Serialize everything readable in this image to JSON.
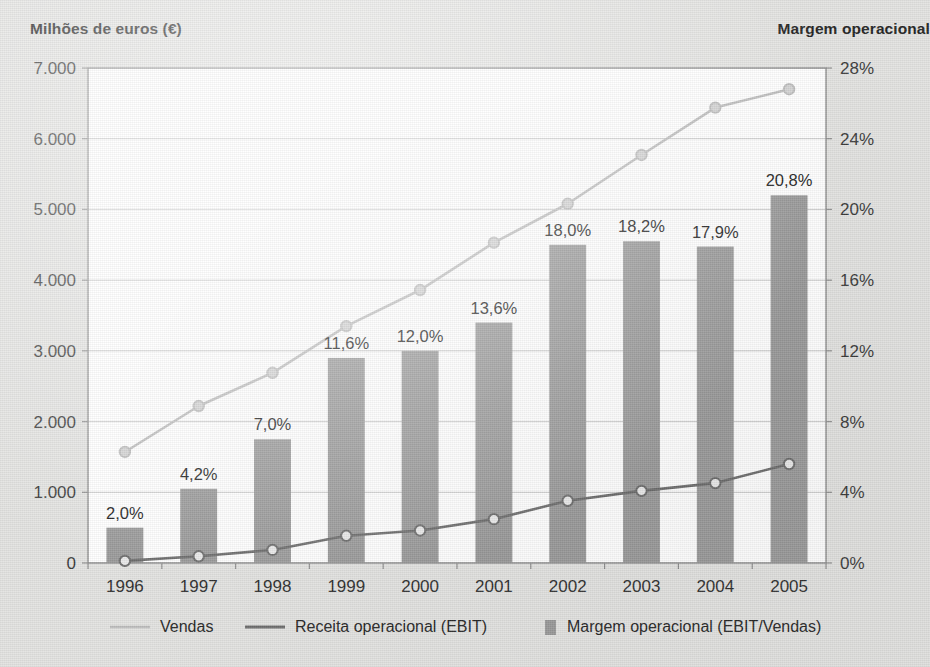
{
  "left_axis_title": "Milhões de euros (€)",
  "right_axis_title": "Margem operacional",
  "legend": [
    {
      "label": "Vendas",
      "marker": "line-light",
      "color": "#bdbdbd"
    },
    {
      "label": "Receita operacional (EBIT)",
      "marker": "line-dark",
      "color": "#6e6e6e"
    },
    {
      "label": "Margem operacional (EBIT/Vendas)",
      "marker": "bar-swatch",
      "color": "#9a9a9a"
    }
  ],
  "colors": {
    "background": "#e3e3e1",
    "plot_background": "#ffffff",
    "gridline": "#c9c9c9",
    "axis_border": "#8f8f8f",
    "bar_fill": "#9a9a9a",
    "vendas_line": "#bdbdbd",
    "ebit_line": "#6e6e6e",
    "text": "#2b2b2b"
  },
  "chart_data": {
    "type": "bar",
    "title": "",
    "subtitle": "",
    "xlabel": "",
    "ylabel": "Milhões de euros (€)",
    "y2label": "Margem operacional",
    "grid": true,
    "legend_position": "bottom",
    "categories": [
      "1996",
      "1997",
      "1998",
      "1999",
      "2000",
      "2001",
      "2002",
      "2003",
      "2004",
      "2005"
    ],
    "ylim": [
      0,
      7000
    ],
    "yticks": [
      0,
      1000,
      2000,
      3000,
      4000,
      5000,
      6000,
      7000
    ],
    "ytick_labels": [
      "0",
      "1.000",
      "2.000",
      "3.000",
      "4.000",
      "5.000",
      "6.000",
      "7.000"
    ],
    "y2lim": [
      0,
      28
    ],
    "y2ticks": [
      0,
      4,
      8,
      12,
      16,
      20,
      24,
      28
    ],
    "y2tick_labels": [
      "0%",
      "4%",
      "8%",
      "12%",
      "16%",
      "20%",
      "24%",
      "28%"
    ],
    "series": [
      {
        "name": "Margem operacional (EBIT/Vendas)",
        "type": "bar",
        "axis": "right",
        "unit": "%",
        "values": [
          2.0,
          4.2,
          7.0,
          11.6,
          12.0,
          13.6,
          18.0,
          18.2,
          17.9,
          20.8
        ],
        "data_labels": [
          "2,0%",
          "4,2%",
          "7,0%",
          "11,6%",
          "12,0%",
          "13,6%",
          "18,0%",
          "18,2%",
          "17,9%",
          "20,8%"
        ]
      },
      {
        "name": "Vendas",
        "type": "line",
        "axis": "left",
        "unit": "M€",
        "values": [
          1570,
          2220,
          2690,
          3350,
          3860,
          4530,
          5080,
          5770,
          6440,
          6700
        ]
      },
      {
        "name": "Receita operacional (EBIT)",
        "type": "line",
        "axis": "left",
        "unit": "M€",
        "values": [
          30,
          95,
          185,
          385,
          460,
          620,
          880,
          1020,
          1130,
          1400
        ]
      }
    ]
  }
}
